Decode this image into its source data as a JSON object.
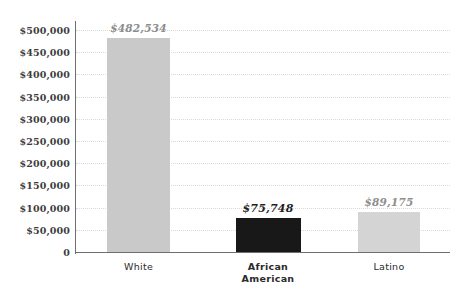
{
  "chart_data": {
    "type": "bar",
    "title": "",
    "subtitle": "",
    "xlabel": "",
    "ylabel": "",
    "categories": [
      "White",
      "African American",
      "Latino"
    ],
    "values": [
      482534,
      75748,
      89175
    ],
    "value_labels": [
      "$482,534",
      "$75,748",
      "$89,175"
    ],
    "ylim": [
      0,
      500000
    ],
    "ytick_values": [
      0,
      50000,
      100000,
      150000,
      200000,
      250000,
      300000,
      350000,
      400000,
      450000,
      500000
    ],
    "ytick_labels": [
      "0",
      "$50,000",
      "$100,000",
      "$150,000",
      "$200,000",
      "$250,000",
      "$300,000",
      "$350,000",
      "$400,000",
      "$450,000",
      "$500,000"
    ],
    "grid": true,
    "grid_style": "dotted",
    "legend": false,
    "bar_colors": [
      "#c9c9c9",
      "#181818",
      "#d4d4d4"
    ],
    "label_emphasis": [
      "muted",
      "strong",
      "muted"
    ],
    "category_emphasis": [
      "regular",
      "bold",
      "regular"
    ],
    "category_lines": [
      [
        "White"
      ],
      [
        "African",
        "American"
      ],
      [
        "Latino"
      ]
    ],
    "axis_color": "#6e6e6e",
    "gridline_color": "#d9d9d9",
    "background": "#ffffff"
  }
}
